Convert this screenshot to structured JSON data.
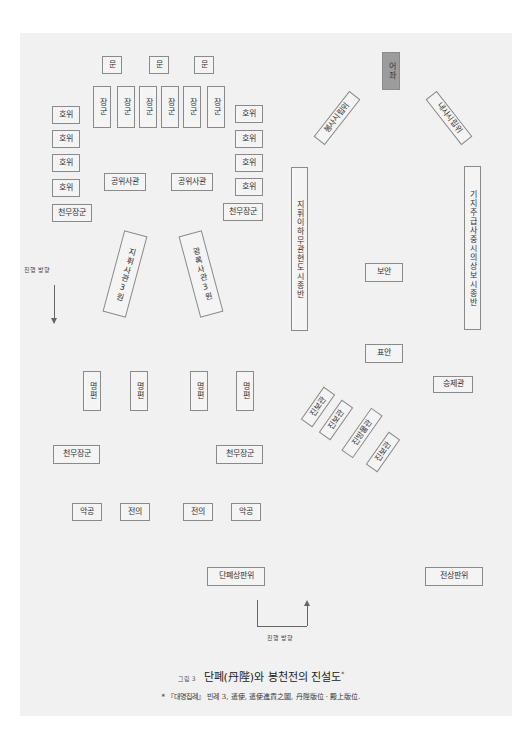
{
  "figure": {
    "number_label": "그림 3",
    "title": "단폐(丹陛)와 봉천전의 진설도",
    "title_mark": "*",
    "footnote": "* 『대명집례』 빈례 3, 遣使, 遣使進貢之圖, 丹陛版位 · 殿上版位."
  },
  "diagram": {
    "throne": "어좌",
    "mun": [
      "문",
      "문",
      "문"
    ],
    "janggun": [
      "장군",
      "장군",
      "장군",
      "장군",
      "장군",
      "장군"
    ],
    "howi_left": [
      "호위",
      "호위",
      "호위",
      "호위"
    ],
    "howi_right": [
      "호위",
      "호위",
      "호위",
      "호위"
    ],
    "cheonmu_upper_left": "천무장군",
    "cheonmu_upper_right": "천무장군",
    "gongwi_left": "공위사관",
    "gongwi_right": "공위사관",
    "envoy_left": "봉사시립위",
    "envoy_right": "내사시립위",
    "column_left": "지휘이하무관현도시종반",
    "column_right": "기지주급사중시의상보시종반",
    "bo_an": "보안",
    "pyo_an": "표안",
    "jihwi": "지휘사관3원",
    "gwangrok": "광록사관3원",
    "direction_left": "진행 방향",
    "direction_bottom": "진행 방향",
    "myeongpyeon": [
      "명편",
      "명편",
      "명편",
      "명편"
    ],
    "seungje": "승제관",
    "jinbo": [
      "진보관",
      "진보관",
      "진방물관",
      "진보관"
    ],
    "cheonmu_lower_left": "천무장군",
    "cheonmu_lower_right": "천무장군",
    "akgong_left": "악공",
    "jeoni_left": "전의",
    "jeoni_right": "전의",
    "akgong_right": "악공",
    "danpye_panwi": "단폐상판위",
    "jeonsang_panwi": "전상판위"
  }
}
